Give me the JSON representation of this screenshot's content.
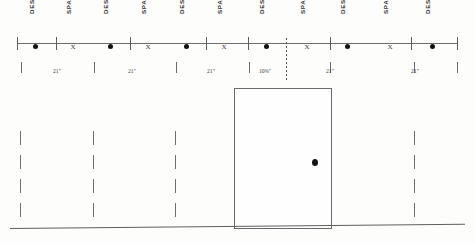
{
  "drawing": {
    "title": "Door and panel layout elevation",
    "colors": {
      "line": "#6a6a6a",
      "marker": "#111111",
      "text": "#333333",
      "background": "#fdfdfb"
    },
    "top_labels": [
      {
        "text": "DESIGN",
        "x": 36
      },
      {
        "text": "SPACE",
        "x": 73
      },
      {
        "text": "DESIGN",
        "x": 110
      },
      {
        "text": "SPACE",
        "x": 148
      },
      {
        "text": "DESIGN",
        "x": 186
      },
      {
        "text": "SPACE",
        "x": 224
      },
      {
        "text": "DESIGN",
        "x": 266
      },
      {
        "text": "SPACE",
        "x": 307
      },
      {
        "text": "DESIGN",
        "x": 347
      },
      {
        "text": "SPACE",
        "x": 390
      },
      {
        "text": "DESIGN",
        "x": 432
      }
    ],
    "axis": {
      "ticks_x": [
        17,
        56,
        130,
        206,
        248,
        330,
        411,
        457
      ]
    },
    "markers": [
      {
        "type": "dot",
        "x": 35
      },
      {
        "type": "x",
        "x": 73,
        "label": "X"
      },
      {
        "type": "dot",
        "x": 110
      },
      {
        "type": "x",
        "x": 148,
        "label": "X"
      },
      {
        "type": "dot",
        "x": 186
      },
      {
        "type": "x",
        "x": 224,
        "label": "X"
      },
      {
        "type": "dot",
        "x": 266
      },
      {
        "type": "x",
        "x": 307,
        "label": "X"
      },
      {
        "type": "dot",
        "x": 347
      },
      {
        "type": "x",
        "x": 390,
        "label": "X"
      },
      {
        "type": "dot",
        "x": 432
      }
    ],
    "dimensions": {
      "ticks_x": [
        21,
        94,
        176,
        249,
        330,
        414,
        457
      ],
      "entries": [
        {
          "value": "21\"",
          "center_x": 57
        },
        {
          "value": "21\"",
          "center_x": 132
        },
        {
          "value": "21\"",
          "center_x": 211
        },
        {
          "value": "10⅜\"",
          "center_x": 265
        },
        {
          "value": "21\"",
          "center_x": 330
        },
        {
          "value": "21\"",
          "center_x": 415
        }
      ]
    },
    "break_lines": [
      {
        "name": "axis-break-dotted",
        "x": 286,
        "y": 38,
        "height": 42
      }
    ],
    "door": {
      "name": "door-elevation",
      "left": 234,
      "top": 88,
      "width": 96,
      "height": 139,
      "knob": {
        "x": 312,
        "y": 159
      }
    },
    "panel_joints": {
      "dashed_x": [
        20,
        93,
        175,
        248,
        331,
        414
      ],
      "solid_x": [
        234,
        330
      ],
      "top": 131,
      "height": 88
    },
    "baseline": {
      "left": 10,
      "top": 228,
      "width": 455,
      "slant_deg": -0.55
    }
  }
}
